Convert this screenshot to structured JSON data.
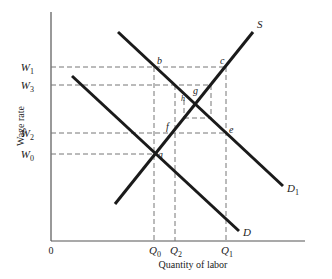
{
  "diagram": {
    "title": "",
    "x_axis_label": "Quantity of labor",
    "y_axis_label": "Wage rate",
    "origin_label": "0",
    "y_ticks": [
      {
        "label": "W",
        "sub": "1",
        "y": 67
      },
      {
        "label": "W",
        "sub": "3",
        "y": 85
      },
      {
        "label": "W",
        "sub": "2",
        "y": 133
      },
      {
        "label": "W",
        "sub": "0",
        "y": 154
      }
    ],
    "x_ticks": [
      {
        "label": "Q",
        "sub": "0",
        "x": 154
      },
      {
        "label": "Q",
        "sub": "2",
        "x": 175
      },
      {
        "label": "Q",
        "sub": "1",
        "x": 226
      }
    ],
    "curves": [
      {
        "name": "S",
        "label": "S",
        "sub": "",
        "x1": 115,
        "y1": 204,
        "x2": 253,
        "y2": 32
      },
      {
        "name": "D",
        "label": "D",
        "sub": "",
        "x1": 72,
        "y1": 76,
        "x2": 239,
        "y2": 231
      },
      {
        "name": "D1",
        "label": "D",
        "sub": "1",
        "x1": 118,
        "y1": 32,
        "x2": 283,
        "y2": 186
      }
    ],
    "points": [
      {
        "label": "a",
        "x": 154,
        "y": 154
      },
      {
        "label": "b",
        "x": 154,
        "y": 67
      },
      {
        "label": "c",
        "x": 226,
        "y": 67
      },
      {
        "label": "e",
        "x": 226,
        "y": 133
      },
      {
        "label": "f",
        "x": 172,
        "y": 133
      },
      {
        "label": "g",
        "x": 196,
        "y": 98
      },
      {
        "label": "h",
        "x": 184,
        "y": 100
      }
    ]
  }
}
